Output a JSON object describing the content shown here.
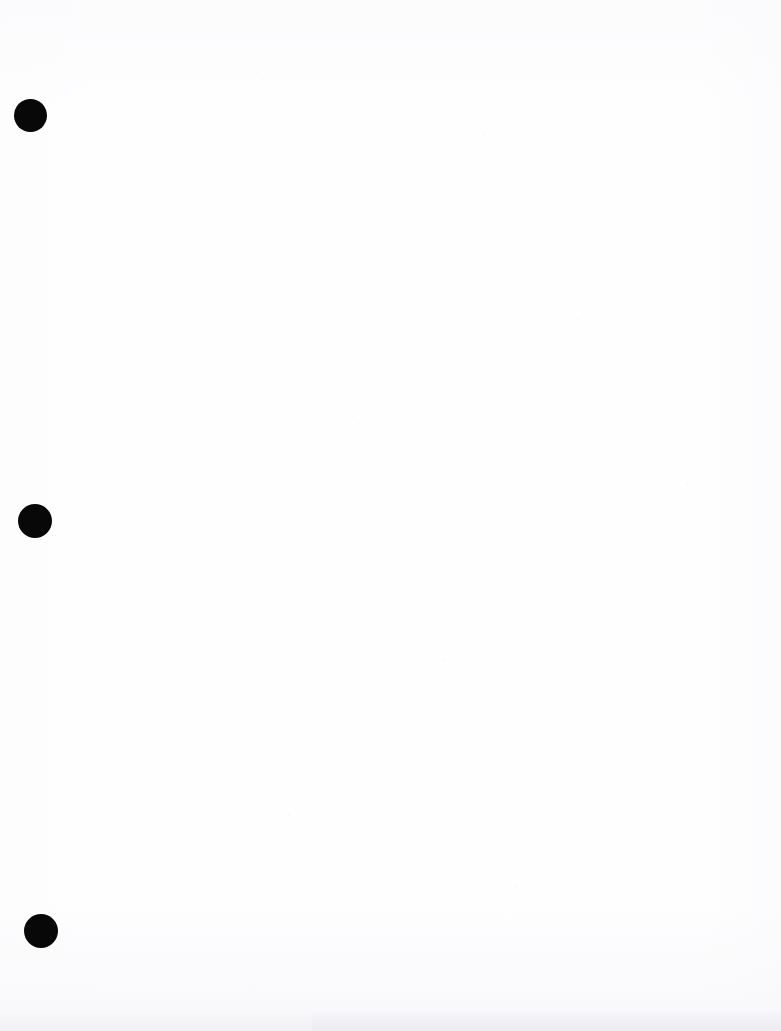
{
  "page": {
    "kind": "scanned-blank-page",
    "width": 781,
    "height": 1031,
    "background_color": "#fefeff",
    "content_text": "",
    "visible_text": "none",
    "description_label": ""
  },
  "artifacts": {
    "ink_color": "#080808",
    "noise_color": "#f1f1f5",
    "bottom_band_color": "#ececf1"
  },
  "hole_punches": [
    {
      "name": "hole-punch-top",
      "cx": 30.5,
      "cy": 115.5,
      "d": 33
    },
    {
      "name": "hole-punch-middle",
      "cx": 35.0,
      "cy": 521.0,
      "d": 34
    },
    {
      "name": "hole-punch-bottom",
      "cx": 41.0,
      "cy": 931.0,
      "d": 34
    }
  ]
}
